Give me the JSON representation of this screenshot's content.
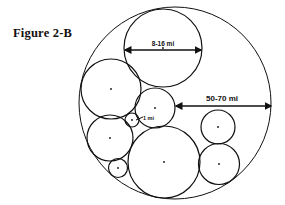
{
  "figure": {
    "title": "Figure 2-B"
  },
  "labels": {
    "top_circle_diameter": "8-16 mi",
    "outer_radius": "50-70 mi",
    "small_circle": "1 mi"
  },
  "colors": {
    "stroke": "#111111",
    "background": "#ffffff"
  },
  "circles": [
    {
      "name": "outer",
      "cx": 175,
      "cy": 103,
      "r": 96
    },
    {
      "name": "top",
      "cx": 163,
      "cy": 48,
      "r": 39
    },
    {
      "name": "upper-left",
      "cx": 111,
      "cy": 89,
      "r": 30
    },
    {
      "name": "center-small",
      "cx": 155,
      "cy": 108,
      "r": 20
    },
    {
      "name": "tiny-1mi",
      "cx": 132,
      "cy": 120,
      "r": 7
    },
    {
      "name": "lower-left",
      "cx": 110,
      "cy": 138,
      "r": 23
    },
    {
      "name": "bottom-left-small",
      "cx": 118,
      "cy": 168,
      "r": 9.5
    },
    {
      "name": "bottom-large",
      "cx": 164,
      "cy": 162,
      "r": 36
    },
    {
      "name": "right-upper",
      "cx": 218,
      "cy": 127,
      "r": 17
    },
    {
      "name": "right-lower",
      "cx": 219,
      "cy": 164,
      "r": 20.5
    }
  ]
}
